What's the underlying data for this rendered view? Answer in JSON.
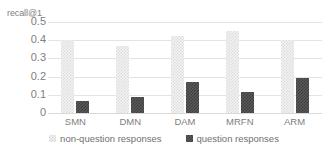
{
  "chart_data": {
    "type": "bar",
    "title": "",
    "xlabel": "",
    "ylabel": "recall@1",
    "ylim": [
      0,
      0.5
    ],
    "ytick_labels": [
      "0.5",
      "0.4",
      "0.3",
      "0.2",
      "0.1",
      "0"
    ],
    "ytick_values": [
      0.5,
      0.4,
      0.3,
      0.2,
      0.1,
      0
    ],
    "grid": true,
    "legend_position": "bottom",
    "categories": [
      "SMN",
      "DMN",
      "DAM",
      "MRFN",
      "ARM"
    ],
    "series": [
      {
        "name": "non-question responses",
        "style": "light-checker",
        "color": "#eaeaea",
        "values": [
          0.4,
          0.367,
          0.425,
          0.45,
          0.4
        ]
      },
      {
        "name": "question responses",
        "style": "dark-checker",
        "color": "#4d4d4d",
        "values": [
          0.068,
          0.088,
          0.173,
          0.113,
          0.19
        ]
      }
    ]
  },
  "axis": {
    "y_title": "recall@1"
  },
  "legend": {
    "entries": [
      {
        "label": "non-question responses",
        "marker": "light-checker-swatch"
      },
      {
        "label": "question responses",
        "marker": "dark-checker-swatch"
      }
    ]
  }
}
